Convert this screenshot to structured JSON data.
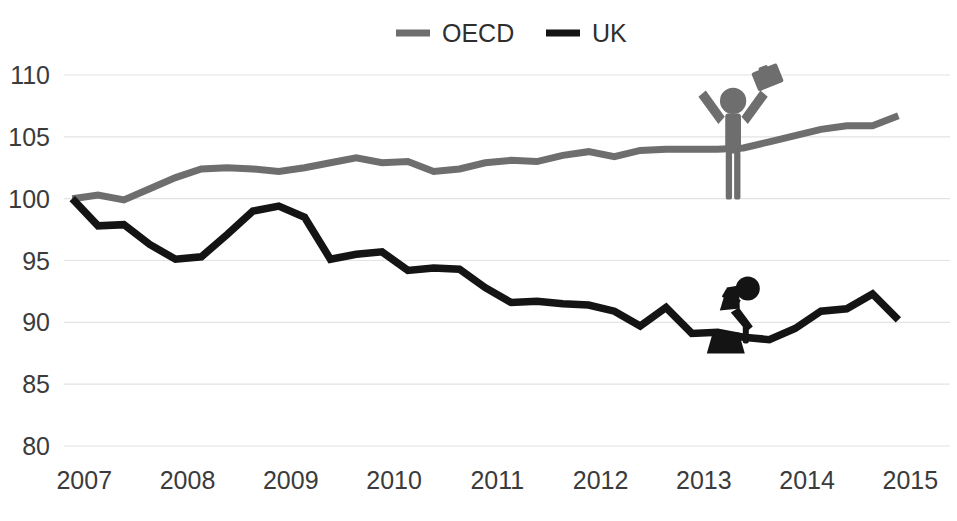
{
  "chart_data": {
    "type": "line",
    "title": "",
    "subtitle": "",
    "xlabel": "",
    "ylabel": "",
    "grid": true,
    "legend_position": "top-center",
    "xlim": [
      2006.92,
      2015.5
    ],
    "ylim": [
      80,
      112
    ],
    "yticks": [
      "80",
      "85",
      "90",
      "95",
      "100",
      "105",
      "110"
    ],
    "ytick_values": [
      80,
      85,
      90,
      95,
      100,
      105,
      110
    ],
    "xticks": [
      "2007",
      "2008",
      "2009",
      "2010",
      "2011",
      "2012",
      "2013",
      "2014",
      "2015"
    ],
    "xtick_values": [
      2007,
      2008,
      2009,
      2010,
      2011,
      2012,
      2013,
      2014,
      2015
    ],
    "x": [
      2007.0,
      2007.25,
      2007.5,
      2007.75,
      2008.0,
      2008.25,
      2008.5,
      2008.75,
      2009.0,
      2009.25,
      2009.5,
      2009.75,
      2010.0,
      2010.25,
      2010.5,
      2010.75,
      2011.0,
      2011.25,
      2011.5,
      2011.75,
      2012.0,
      2012.25,
      2012.5,
      2012.75,
      2013.0,
      2013.25,
      2013.5,
      2013.75,
      2014.0,
      2014.25,
      2014.5,
      2014.75,
      2015.0
    ],
    "series": [
      {
        "name": "OECD",
        "color": "#6e6e6e",
        "values": [
          100.0,
          100.3,
          99.9,
          100.8,
          101.7,
          102.4,
          102.5,
          102.4,
          102.2,
          102.5,
          102.9,
          103.3,
          102.9,
          103.0,
          102.2,
          102.4,
          102.9,
          103.1,
          103.0,
          103.5,
          103.8,
          103.4,
          103.9,
          104.0,
          104.0,
          104.0,
          104.1,
          104.6,
          105.1,
          105.6,
          105.9,
          105.9,
          106.7
        ]
      },
      {
        "name": "UK",
        "color": "#141414",
        "values": [
          100.0,
          97.8,
          97.9,
          96.3,
          95.1,
          95.3,
          97.1,
          99.0,
          99.4,
          98.5,
          95.1,
          95.5,
          95.7,
          94.2,
          94.4,
          94.3,
          92.8,
          91.6,
          91.7,
          91.5,
          91.4,
          90.9,
          89.7,
          91.2,
          89.1,
          89.2,
          88.8,
          88.6,
          89.5,
          90.9,
          91.1,
          92.3,
          90.2
        ]
      }
    ],
    "annotations": [
      {
        "name": "cheering-figure",
        "series": "OECD",
        "description": "gray celebrating stick figure with arms raised holding a briefcase",
        "color": "#6e6e6e",
        "at_x": 2013.4,
        "at_y": 104.0
      },
      {
        "name": "despairing-figure",
        "series": "UK",
        "description": "black stick figure sitting on a block with head in hands",
        "color": "#141414",
        "at_x": 2013.3,
        "at_y": 89.1
      }
    ],
    "colors": {
      "oecd": "#6e6e6e",
      "uk": "#141414",
      "gridline": "#e3e3e3",
      "tick_text": "#3b3b3b",
      "background": "#ffffff"
    }
  },
  "legend": {
    "items": [
      {
        "label": "OECD",
        "color": "#6e6e6e"
      },
      {
        "label": "UK",
        "color": "#141414"
      }
    ]
  }
}
